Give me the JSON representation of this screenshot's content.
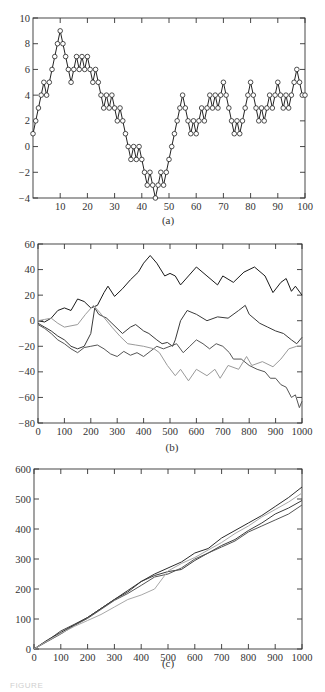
{
  "figure": {
    "caption_fragment": "FIGURE"
  },
  "chart_data": [
    {
      "id": "a",
      "panel_label": "(a)",
      "type": "line",
      "title": "",
      "xlabel": "",
      "ylabel": "",
      "xlim": [
        0,
        100
      ],
      "ylim": [
        -4,
        10
      ],
      "xticks": [
        10,
        20,
        30,
        40,
        50,
        60,
        70,
        80,
        90,
        100
      ],
      "yticks": [
        -4,
        -2,
        0,
        2,
        4,
        6,
        8,
        10
      ],
      "ytick_labels": [
        "−4",
        "−2",
        "0",
        "2",
        "4",
        "6",
        "8",
        "10"
      ],
      "markers": "open-circle",
      "grid": false,
      "legend": false,
      "x": [
        0,
        1,
        2,
        3,
        4,
        5,
        6,
        7,
        8,
        9,
        10,
        11,
        12,
        13,
        14,
        15,
        16,
        17,
        18,
        19,
        20,
        21,
        22,
        23,
        24,
        25,
        26,
        27,
        28,
        29,
        30,
        31,
        32,
        33,
        34,
        35,
        36,
        37,
        38,
        39,
        40,
        41,
        42,
        43,
        44,
        45,
        46,
        47,
        48,
        49,
        50,
        51,
        52,
        53,
        54,
        55,
        56,
        57,
        58,
        59,
        60,
        61,
        62,
        63,
        64,
        65,
        66,
        67,
        68,
        69,
        70,
        71,
        72,
        73,
        74,
        75,
        76,
        77,
        78,
        79,
        80,
        81,
        82,
        83,
        84,
        85,
        86,
        87,
        88,
        89,
        90,
        91,
        92,
        93,
        94,
        95,
        96,
        97,
        98,
        99,
        100
      ],
      "series": [
        {
          "name": "random walk",
          "color": "#222222",
          "values": [
            1,
            2,
            3,
            4,
            5,
            4,
            5,
            6,
            7,
            8,
            9,
            8,
            7,
            6,
            5,
            6,
            7,
            6,
            7,
            6,
            7,
            6,
            5,
            6,
            5,
            4,
            3,
            4,
            3,
            4,
            3,
            2,
            3,
            2,
            1,
            0,
            -1,
            0,
            -1,
            0,
            -1,
            -2,
            -3,
            -2,
            -3,
            -4,
            -3,
            -2,
            -3,
            -2,
            -1,
            0,
            1,
            2,
            3,
            4,
            3,
            2,
            1,
            2,
            1,
            2,
            3,
            2,
            3,
            4,
            3,
            4,
            3,
            4,
            5,
            4,
            3,
            2,
            1,
            2,
            1,
            2,
            3,
            4,
            5,
            4,
            3,
            2,
            3,
            2,
            3,
            4,
            3,
            4,
            5,
            4,
            3,
            4,
            3,
            4,
            5,
            6,
            5,
            4,
            4
          ]
        }
      ]
    },
    {
      "id": "b",
      "panel_label": "(b)",
      "type": "line",
      "title": "",
      "xlabel": "",
      "ylabel": "",
      "xlim": [
        0,
        1000
      ],
      "ylim": [
        -80,
        60
      ],
      "xticks": [
        0,
        100,
        200,
        300,
        400,
        500,
        600,
        700,
        800,
        900,
        1000
      ],
      "yticks": [
        -80,
        -60,
        -40,
        -20,
        0,
        20,
        40,
        60
      ],
      "ytick_labels": [
        "−80",
        "−60",
        "−40",
        "−20",
        "0",
        "20",
        "40",
        "60"
      ],
      "grid": false,
      "legend": false,
      "series": [
        {
          "name": "walk 1",
          "color": "#1a1a1a",
          "x": [
            0,
            25,
            50,
            75,
            100,
            125,
            150,
            175,
            200,
            225,
            250,
            265,
            290,
            320,
            350,
            380,
            400,
            425,
            450,
            480,
            500,
            520,
            540,
            570,
            600,
            640,
            680,
            700,
            740,
            780,
            820,
            860,
            890,
            920,
            940,
            960,
            975,
            1000
          ],
          "values": [
            0,
            -1,
            2,
            8,
            10,
            8,
            17,
            15,
            10,
            12,
            22,
            27,
            19,
            25,
            32,
            38,
            45,
            51,
            45,
            35,
            37,
            35,
            28,
            35,
            42,
            35,
            28,
            35,
            30,
            38,
            42,
            35,
            22,
            30,
            33,
            23,
            27,
            20
          ]
        },
        {
          "name": "walk 2",
          "color": "#3a3a3a",
          "x": [
            0,
            25,
            50,
            75,
            100,
            125,
            150,
            175,
            200,
            215,
            230,
            260,
            280,
            320,
            350,
            370,
            400,
            420,
            450,
            470,
            490,
            510,
            520,
            540,
            565,
            600,
            640,
            680,
            720,
            760,
            785,
            800,
            840,
            870,
            900,
            930,
            960,
            980,
            1000
          ],
          "values": [
            -2,
            -5,
            -8,
            -12,
            -15,
            -20,
            -22,
            -20,
            -10,
            10,
            5,
            2,
            -2,
            -10,
            -5,
            -3,
            -8,
            -10,
            -15,
            -18,
            -17,
            -20,
            -15,
            0,
            8,
            5,
            0,
            3,
            2,
            8,
            12,
            5,
            -2,
            -5,
            -8,
            -10,
            -15,
            -18,
            -13
          ]
        },
        {
          "name": "walk 3",
          "color": "#555555",
          "x": [
            0,
            25,
            50,
            75,
            100,
            125,
            150,
            175,
            200,
            225,
            250,
            275,
            300,
            325,
            350,
            375,
            400,
            425,
            450,
            475,
            500,
            525,
            550,
            575,
            600,
            625,
            650,
            675,
            700,
            725,
            740,
            770,
            800,
            830,
            860,
            880,
            900,
            920,
            940,
            960,
            975,
            990,
            1000
          ],
          "values": [
            -3,
            -6,
            -10,
            -15,
            -18,
            -22,
            -25,
            -21,
            -20,
            -19,
            -22,
            -26,
            -28,
            -24,
            -27,
            -25,
            -28,
            -24,
            -20,
            -22,
            -20,
            -18,
            -25,
            -20,
            -15,
            -18,
            -22,
            -18,
            -20,
            -25,
            -30,
            -30,
            -35,
            -38,
            -40,
            -45,
            -45,
            -50,
            -52,
            -60,
            -58,
            -68,
            -63
          ]
        },
        {
          "name": "walk 4",
          "color": "#9a9a9a",
          "x": [
            0,
            25,
            50,
            75,
            100,
            125,
            150,
            180,
            210,
            240,
            280,
            310,
            340,
            370,
            400,
            440,
            460,
            490,
            520,
            540,
            570,
            600,
            640,
            670,
            690,
            720,
            760,
            790,
            810,
            850,
            890,
            920,
            950,
            980,
            1000
          ],
          "values": [
            0,
            1,
            2,
            -2,
            -5,
            -4,
            -3,
            5,
            12,
            5,
            -5,
            -12,
            -18,
            -19,
            -20,
            -22,
            -25,
            -35,
            -43,
            -38,
            -47,
            -38,
            -43,
            -38,
            -45,
            -35,
            -38,
            -28,
            -35,
            -32,
            -36,
            -30,
            -22,
            -20,
            -20
          ]
        }
      ]
    },
    {
      "id": "c",
      "panel_label": "(c)",
      "type": "line",
      "title": "",
      "xlabel": "",
      "ylabel": "",
      "xlim": [
        0,
        1000
      ],
      "ylim": [
        0,
        600
      ],
      "xticks": [
        0,
        100,
        200,
        300,
        400,
        500,
        600,
        700,
        800,
        900,
        1000
      ],
      "yticks": [
        0,
        100,
        200,
        300,
        400,
        500,
        600
      ],
      "ytick_labels": [
        "0",
        "100",
        "200",
        "300",
        "400",
        "500",
        "600"
      ],
      "grid": false,
      "legend": false,
      "series": [
        {
          "name": "walk 1",
          "color": "#2a2a2a",
          "x": [
            0,
            50,
            100,
            150,
            200,
            250,
            300,
            350,
            400,
            450,
            500,
            550,
            600,
            650,
            700,
            750,
            800,
            850,
            900,
            950,
            1000
          ],
          "values": [
            0,
            30,
            55,
            80,
            105,
            135,
            165,
            195,
            225,
            250,
            270,
            290,
            320,
            335,
            370,
            395,
            420,
            445,
            475,
            505,
            540
          ]
        },
        {
          "name": "walk 2",
          "color": "#3c3c3c",
          "x": [
            0,
            50,
            100,
            150,
            200,
            250,
            300,
            350,
            400,
            450,
            500,
            550,
            600,
            650,
            700,
            750,
            800,
            850,
            900,
            950,
            1000
          ],
          "values": [
            0,
            28,
            60,
            82,
            105,
            135,
            165,
            190,
            225,
            245,
            258,
            265,
            295,
            320,
            345,
            365,
            395,
            420,
            450,
            470,
            495
          ]
        },
        {
          "name": "walk 3",
          "color": "#555555",
          "x": [
            0,
            50,
            100,
            150,
            200,
            250,
            300,
            350,
            400,
            450,
            500,
            550,
            600,
            650,
            700,
            750,
            800,
            850,
            900,
            950,
            1000
          ],
          "values": [
            0,
            25,
            50,
            78,
            102,
            132,
            162,
            185,
            212,
            240,
            250,
            270,
            300,
            320,
            340,
            360,
            390,
            410,
            430,
            450,
            480
          ]
        },
        {
          "name": "walk 4",
          "color": "#a8a8a8",
          "x": [
            0,
            50,
            100,
            150,
            200,
            250,
            300,
            350,
            400,
            450,
            500,
            550,
            600,
            650,
            700,
            750,
            800,
            850,
            900,
            950,
            1000
          ],
          "values": [
            0,
            27,
            52,
            75,
            95,
            115,
            140,
            165,
            180,
            200,
            260,
            285,
            305,
            330,
            355,
            385,
            410,
            440,
            465,
            490,
            520
          ]
        }
      ]
    }
  ],
  "layout": {
    "panels": [
      {
        "id": "a",
        "plot": {
          "left": 33,
          "top": 18,
          "right": 305,
          "bottom": 198
        },
        "label_x": 168,
        "label_y": 214
      },
      {
        "id": "b",
        "plot": {
          "left": 38,
          "top": 244,
          "right": 302,
          "bottom": 423
        },
        "label_x": 172,
        "label_y": 441
      },
      {
        "id": "c",
        "plot": {
          "left": 34,
          "top": 469,
          "right": 302,
          "bottom": 649
        },
        "label_x": 168,
        "label_y": 657
      }
    ]
  }
}
